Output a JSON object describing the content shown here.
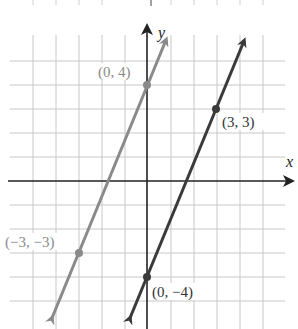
{
  "graph": {
    "x_axis_label": "x",
    "y_axis_label": "y",
    "grid": {
      "x_range": [
        -6,
        6
      ],
      "y_range": [
        -5,
        6
      ],
      "step": 1
    },
    "colors": {
      "light_line": "#8a8a8a",
      "dark_line": "#3a3a3a",
      "axis": "#222222",
      "grid": "#c8c8c8"
    },
    "lines": [
      {
        "name": "light-line",
        "equation": "y = (7/3)x + 4",
        "points": [
          {
            "x": 0,
            "y": 4,
            "label": "(0, 4)"
          },
          {
            "x": -3,
            "y": -3,
            "label": "(−3, −3)"
          }
        ]
      },
      {
        "name": "dark-line",
        "equation": "y = (7/3)x - 4",
        "points": [
          {
            "x": 3,
            "y": 3,
            "label": "(3, 3)"
          },
          {
            "x": 0,
            "y": -4,
            "label": "(0, −4)"
          }
        ]
      }
    ]
  }
}
